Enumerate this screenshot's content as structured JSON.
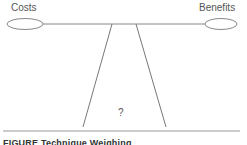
{
  "diagram": {
    "left_pan": {
      "label": "Costs"
    },
    "right_pan": {
      "label": "Benefits"
    },
    "fulcrum": {
      "label": "?"
    },
    "caption": "FIGURE Technique Weighing"
  },
  "colors": {
    "line": "#777777",
    "text": "#555555",
    "baseline": "#888888"
  }
}
